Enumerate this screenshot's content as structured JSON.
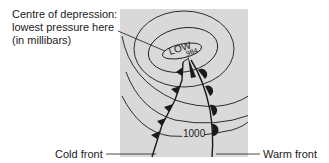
{
  "diagram": {
    "type": "weather-map-depression",
    "low_pressure_label": "LOW",
    "central_pressure": "984",
    "isobar_label": "1000",
    "units": "millibars",
    "colors": {
      "map_background": "#d9d9d9",
      "lines": "#1a1a1a",
      "page_background": "#ffffff"
    },
    "annotations": {
      "centre": {
        "line1": "Centre of depression:",
        "line2": "lowest pressure here",
        "line3": "(in millibars)"
      },
      "cold_front": "Cold front",
      "warm_front": "Warm front"
    },
    "fronts": [
      {
        "name": "cold-front",
        "symbol": "triangles",
        "count": 5
      },
      {
        "name": "warm-front",
        "symbol": "semicircles",
        "count": 4
      }
    ]
  }
}
